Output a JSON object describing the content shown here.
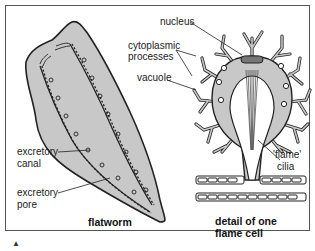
{
  "diagram": {
    "colors": {
      "body_fill": "#c8c8c8",
      "outline": "#222222",
      "background": "#ffffff",
      "nucleus_fill": "#777777"
    },
    "flatworm": {
      "title": "flatworm",
      "labels": {
        "excretory_canal": [
          "excretory",
          "canal"
        ],
        "excretory_pore": [
          "excretory",
          "pore"
        ]
      }
    },
    "flame_cell": {
      "title_line1": "detail of one",
      "title_line2": "flame cell",
      "labels": {
        "nucleus": "nucleus",
        "cytoplasmic_processes_line1": "cytoplasmic",
        "cytoplasmic_processes_line2": "processes",
        "vacuole": "vacuole",
        "flame_line1": "'flame'",
        "flame_line2": "cilia"
      }
    },
    "caption_marker": "▲"
  }
}
